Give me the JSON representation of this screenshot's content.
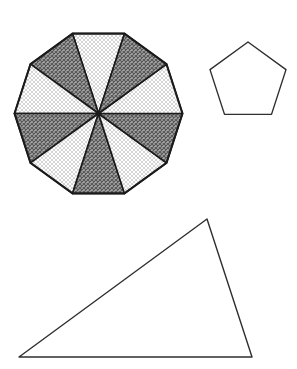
{
  "canvas": {
    "width": 297,
    "height": 369,
    "background": "#ffffff"
  },
  "colors": {
    "outline_dark": "#1b1b1b",
    "outline_medium": "#2f2f2f",
    "dark_texture": {
      "background": "#ababab",
      "line": "#575757"
    },
    "light_texture": {
      "background": "#ffffff",
      "line": "#d5d5d5"
    },
    "plain_fill": "#ffffff"
  },
  "shapes": {
    "decagon": {
      "label": "regular decagon divided into 10 sectors",
      "center": {
        "x": 98.5,
        "y": 113.5
      },
      "radius": 84,
      "sides": 10,
      "start_angle_deg": 72,
      "sector_fills": [
        "light",
        "dark",
        "light",
        "dark",
        "light",
        "dark",
        "light",
        "dark",
        "light",
        "dark"
      ],
      "outline_width": 2,
      "sector_stroke_width": 1.6
    },
    "pentagon": {
      "label": "regular pentagon outline",
      "center": {
        "x": 248,
        "y": 82
      },
      "radius": 40,
      "sides": 5,
      "start_angle_deg": 90,
      "fill": "plain",
      "stroke_width": 1.4
    },
    "triangle": {
      "label": "scalene triangle outline",
      "points": [
        [
          19,
          357
        ],
        [
          207,
          219
        ],
        [
          252,
          357
        ]
      ],
      "fill": "plain",
      "stroke_width": 1.4
    }
  }
}
